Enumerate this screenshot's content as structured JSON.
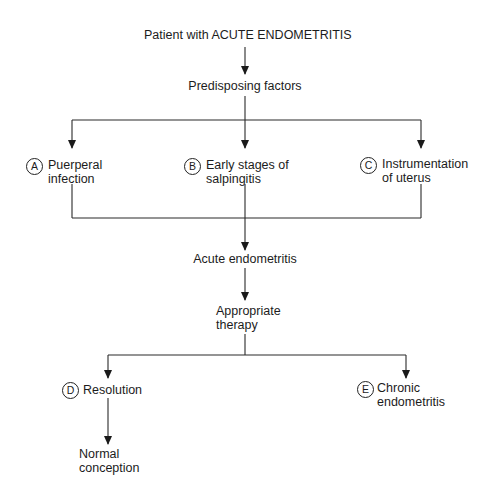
{
  "title": "Patient with ACUTE ENDOMETRITIS",
  "nodes": {
    "predisposing": "Predisposing factors",
    "a": {
      "badge": "A",
      "line1": "Puerperal",
      "line2": "infection"
    },
    "b": {
      "badge": "B",
      "line1": "Early stages of",
      "line2": "salpingitis"
    },
    "c": {
      "badge": "C",
      "line1": "Instrumentation",
      "line2": "of uterus"
    },
    "acute": "Acute endometritis",
    "therapy": {
      "line1": "Appropriate",
      "line2": "therapy"
    },
    "d": {
      "badge": "D",
      "line1": "Resolution"
    },
    "e": {
      "badge": "E",
      "line1": "Chronic",
      "line2": "endometritis"
    },
    "normal": {
      "line1": "Normal",
      "line2": "conception"
    }
  },
  "colors": {
    "line": "#2a2a2a",
    "background": "#ffffff"
  }
}
